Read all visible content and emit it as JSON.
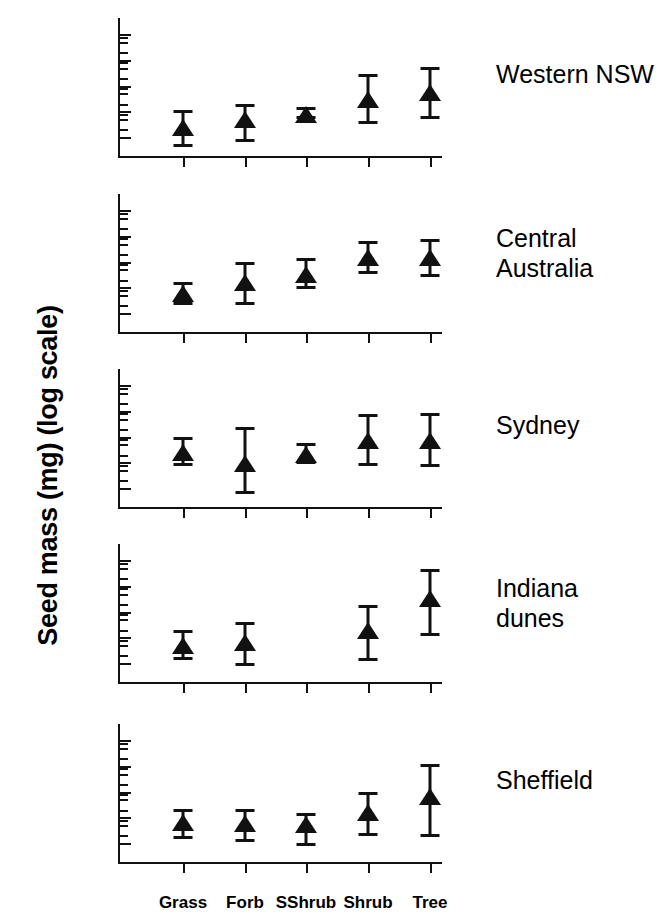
{
  "chart_data": {
    "type": "scatter",
    "title": "",
    "xlabel": "",
    "ylabel": "Seed mass (mg) (log scale)",
    "yscale": "log",
    "ylim": [
      0.03,
      3000
    ],
    "ytick_labels": [
      "1000",
      "100",
      "10",
      "1",
      "0.1"
    ],
    "ytick_values": [
      1000,
      100,
      10,
      1,
      0.1
    ],
    "minor_ticks": true,
    "grid": false,
    "legend": "none",
    "categories": [
      "Grass",
      "Forb",
      "SShrub",
      "Shrub",
      "Tree"
    ],
    "marker": "filled-triangle",
    "error_style": "capped-vertical-range",
    "panels": [
      {
        "name": "Western NSW",
        "label": "Western NSW",
        "label_lines": [
          "Western NSW"
        ],
        "points": [
          {
            "category": "Grass",
            "value": 0.22,
            "low": 0.05,
            "high": 1.0
          },
          {
            "category": "Forb",
            "value": 0.45,
            "low": 0.08,
            "high": 1.8
          },
          {
            "category": "SShrub",
            "value": 0.75,
            "low": 0.6,
            "high": 1.3
          },
          {
            "category": "Shrub",
            "value": 2.8,
            "low": 0.4,
            "high": 25
          },
          {
            "category": "Tree",
            "value": 5.0,
            "low": 0.6,
            "high": 50
          }
        ]
      },
      {
        "name": "Central Australia",
        "label": "Central Australia",
        "label_lines": [
          "Central",
          "Australia"
        ],
        "points": [
          {
            "category": "Grass",
            "value": 0.55,
            "low": 0.25,
            "high": 1.5
          },
          {
            "category": "Forb",
            "value": 1.5,
            "low": 0.25,
            "high": 9.0
          },
          {
            "category": "SShrub",
            "value": 3.0,
            "low": 1.0,
            "high": 13
          },
          {
            "category": "Shrub",
            "value": 14,
            "low": 4.0,
            "high": 55
          },
          {
            "category": "Tree",
            "value": 14,
            "low": 3.0,
            "high": 70
          }
        ]
      },
      {
        "name": "Sydney",
        "label": "Sydney",
        "label_lines": [
          "Sydney"
        ],
        "points": [
          {
            "category": "Grass",
            "value": 2.4,
            "low": 0.85,
            "high": 9.0
          },
          {
            "category": "Forb",
            "value": 0.9,
            "low": 0.07,
            "high": 22
          },
          {
            "category": "SShrub",
            "value": 2.0,
            "low": 1.0,
            "high": 5.0
          },
          {
            "category": "Shrub",
            "value": 6.5,
            "low": 0.85,
            "high": 70
          },
          {
            "category": "Tree",
            "value": 7.0,
            "low": 0.8,
            "high": 75
          }
        ]
      },
      {
        "name": "Indiana dunes",
        "label": "Indiana dunes",
        "label_lines": [
          "Indiana",
          "dunes"
        ],
        "points": [
          {
            "category": "Grass",
            "value": 0.45,
            "low": 0.16,
            "high": 1.7
          },
          {
            "category": "Forb",
            "value": 0.6,
            "low": 0.09,
            "high": 3.5
          },
          {
            "category": "SShrub",
            "value": null,
            "low": null,
            "high": null
          },
          {
            "category": "Shrub",
            "value": 1.7,
            "low": 0.14,
            "high": 16
          },
          {
            "category": "Tree",
            "value": 30,
            "low": 1.3,
            "high": 420
          }
        ]
      },
      {
        "name": "Sheffield",
        "label": "Sheffield",
        "label_lines": [
          "Sheffield"
        ],
        "points": [
          {
            "category": "Grass",
            "value": 0.6,
            "low": 0.18,
            "high": 1.9
          },
          {
            "category": "Forb",
            "value": 0.55,
            "low": 0.13,
            "high": 1.9
          },
          {
            "category": "SShrub",
            "value": 0.5,
            "low": 0.09,
            "high": 1.4
          },
          {
            "category": "Shrub",
            "value": 1.5,
            "low": 0.22,
            "high": 8.5
          },
          {
            "category": "Tree",
            "value": 6.0,
            "low": 0.2,
            "high": 110
          }
        ]
      }
    ]
  }
}
